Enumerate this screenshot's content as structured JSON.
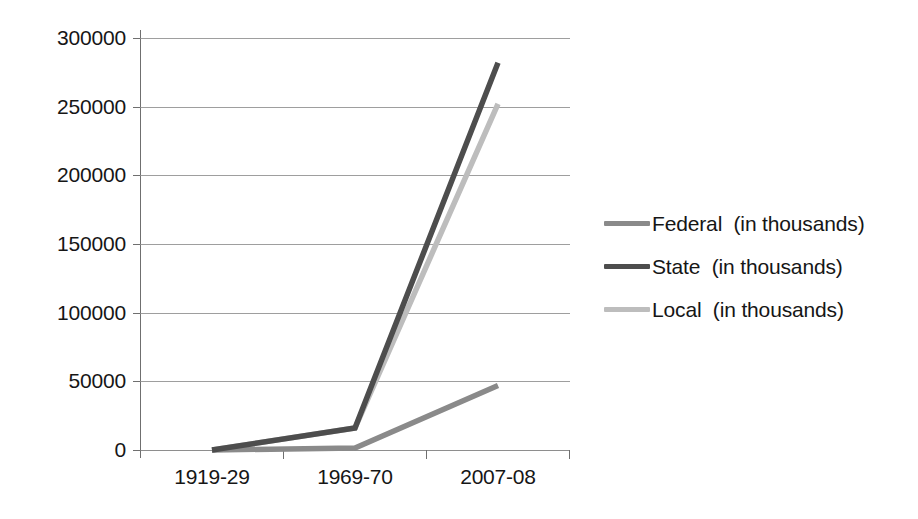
{
  "chart_data": {
    "type": "line",
    "title": "",
    "subtitle": "",
    "xlabel": "",
    "ylabel": "",
    "categories": [
      "1919-29",
      "1969-70",
      "2007-08"
    ],
    "x": [
      "1919-29",
      "1969-70",
      "2007-08"
    ],
    "ylim": [
      0,
      300000
    ],
    "yticks": [
      0,
      50000,
      100000,
      150000,
      200000,
      250000,
      300000
    ],
    "ytick_labels": [
      "0",
      "50000",
      "100000",
      "150000",
      "200000",
      "250000",
      "300000"
    ],
    "xtick_labels": [
      "1919-29",
      "1969-70",
      "2007-08"
    ],
    "grid": true,
    "grid_axis": "y",
    "legend_position": "right",
    "series": [
      {
        "name": "Federal  (in thousands)",
        "short_name": "Federal",
        "unit_note": "(in thousands)",
        "color": "#8a8a8a",
        "values": [
          0,
          1500,
          47000
        ]
      },
      {
        "name": "State  (in thousands)",
        "short_name": "State",
        "unit_note": "(in thousands)",
        "color": "#4d4d4d",
        "values": [
          0,
          16000,
          282000
        ]
      },
      {
        "name": "Local  (in thousands)",
        "short_name": "Local",
        "unit_note": "(in thousands)",
        "color": "#bdbdbd",
        "values": [
          0,
          16000,
          252000
        ]
      }
    ]
  },
  "axes": {
    "y_tick_labels": [
      "300000",
      "250000",
      "200000",
      "150000",
      "100000",
      "50000",
      "0"
    ],
    "x_tick_labels": [
      "1919-29",
      "1969-70",
      "2007-08"
    ]
  },
  "legend": {
    "items": [
      {
        "label": "Federal  (in thousands)",
        "color": "#8a8a8a"
      },
      {
        "label": "State  (in thousands)",
        "color": "#4d4d4d"
      },
      {
        "label": "Local  (in thousands)",
        "color": "#bdbdbd"
      }
    ]
  },
  "colors": {
    "federal": "#8a8a8a",
    "state": "#4d4d4d",
    "local": "#bdbdbd",
    "gridline": "#8d8d8d",
    "axis": "#6f6f6f",
    "text": "#161616",
    "background": "#ffffff"
  }
}
